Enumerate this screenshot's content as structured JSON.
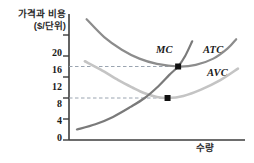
{
  "figure": {
    "y_axis_title_line1": "가격과 비용",
    "y_axis_title_line2": "($/단위)",
    "x_axis_title": "수량"
  },
  "labels": {
    "mc": "MC",
    "atc": "ATC",
    "avc": "AVC"
  },
  "chart_data": {
    "type": "line",
    "title": "",
    "xlabel": "수량",
    "ylabel": "가격과 비용 ($/단위)",
    "xlim": [
      0,
      10
    ],
    "ylim": [
      0,
      24
    ],
    "grid": false,
    "legend": "inline-curve-labels",
    "y_ticks": [
      0,
      4,
      8,
      12,
      16,
      20
    ],
    "y_tick_labels": [
      "0",
      "4",
      "8",
      "12",
      "16",
      "20"
    ],
    "x_ticks": [],
    "x_tick_labels": [],
    "series": [
      {
        "name": "MC",
        "color": "#7a7a7a",
        "points": [
          [
            0.45,
            2.0
          ],
          [
            1.5,
            3.0
          ],
          [
            2.5,
            4.4
          ],
          [
            3.5,
            6.3
          ],
          [
            4.3,
            8.0
          ],
          [
            5.0,
            10.0
          ],
          [
            5.7,
            12.4
          ],
          [
            6.2,
            14.0
          ],
          [
            6.6,
            16.0
          ],
          [
            7.0,
            18.8
          ]
        ]
      },
      {
        "name": "ATC",
        "color": "#8c8c8c",
        "points": [
          [
            1.0,
            23.0
          ],
          [
            2.0,
            19.6
          ],
          [
            3.0,
            17.2
          ],
          [
            4.0,
            15.5
          ],
          [
            5.0,
            14.5
          ],
          [
            6.2,
            14.0
          ],
          [
            7.2,
            14.3
          ],
          [
            8.2,
            15.5
          ],
          [
            9.0,
            17.4
          ],
          [
            9.5,
            19.2
          ]
        ]
      },
      {
        "name": "AVC",
        "color": "#c4c4c4",
        "points": [
          [
            0.9,
            15.0
          ],
          [
            1.8,
            13.4
          ],
          [
            2.8,
            11.4
          ],
          [
            3.6,
            10.0
          ],
          [
            4.3,
            8.9
          ],
          [
            5.0,
            8.2
          ],
          [
            5.6,
            8.0
          ],
          [
            6.5,
            8.4
          ],
          [
            7.5,
            9.6
          ],
          [
            8.6,
            11.4
          ],
          [
            9.6,
            13.6
          ]
        ]
      }
    ],
    "annotations": [
      {
        "name": "mc-avc-minimum",
        "x": 5.6,
        "y": 8.0,
        "marker": "square",
        "color": "#111111",
        "guide": "dashed-horizontal-to-y-axis"
      },
      {
        "name": "mc-atc-minimum",
        "x": 6.2,
        "y": 14.0,
        "marker": "square",
        "color": "#111111",
        "guide": "dashed-horizontal-to-y-axis"
      }
    ]
  },
  "colors": {
    "axis": "#3c3c3c",
    "mc": "#7a7a7a",
    "atc": "#8c8c8c",
    "avc": "#c4c4c4",
    "marker": "#111111",
    "dash": "#9aa4b0",
    "text": "#1a1a1a"
  }
}
